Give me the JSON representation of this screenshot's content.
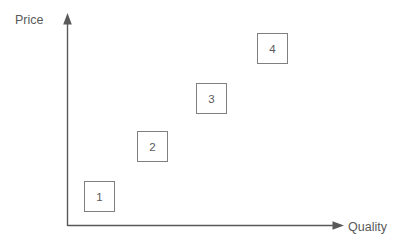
{
  "chart_data": {
    "type": "scatter",
    "title": "",
    "xlabel": "Quality",
    "ylabel": "Price",
    "grid": false,
    "legend": null,
    "axis_style": "arrow",
    "xlim": [
      0,
      10
    ],
    "ylim": [
      0,
      10
    ],
    "x_tick_labels": [],
    "y_tick_labels": [],
    "marker_shape": "square-box-with-label",
    "points": [
      {
        "label": "1",
        "x": 1.0,
        "y": 1.2,
        "box_left": 84,
        "box_top": 181,
        "box_size": 31
      },
      {
        "label": "2",
        "x": 2.9,
        "y": 3.6,
        "box_left": 137,
        "box_top": 131,
        "box_size": 31
      },
      {
        "label": "3",
        "x": 5.1,
        "y": 5.9,
        "box_left": 196,
        "box_top": 83,
        "box_size": 31
      },
      {
        "label": "4",
        "x": 7.3,
        "y": 8.0,
        "box_left": 257,
        "box_top": 33,
        "box_size": 31
      }
    ]
  },
  "colors": {
    "background": "#ffffff",
    "axis": "#595959",
    "box_border": "#7f7f7f",
    "text": "#595959"
  },
  "watermarks": [
    {
      "text": "",
      "left": 300,
      "top": 12
    },
    {
      "text": "",
      "left": 310,
      "top": 30
    },
    {
      "text": "",
      "left": 10,
      "top": 232
    }
  ]
}
